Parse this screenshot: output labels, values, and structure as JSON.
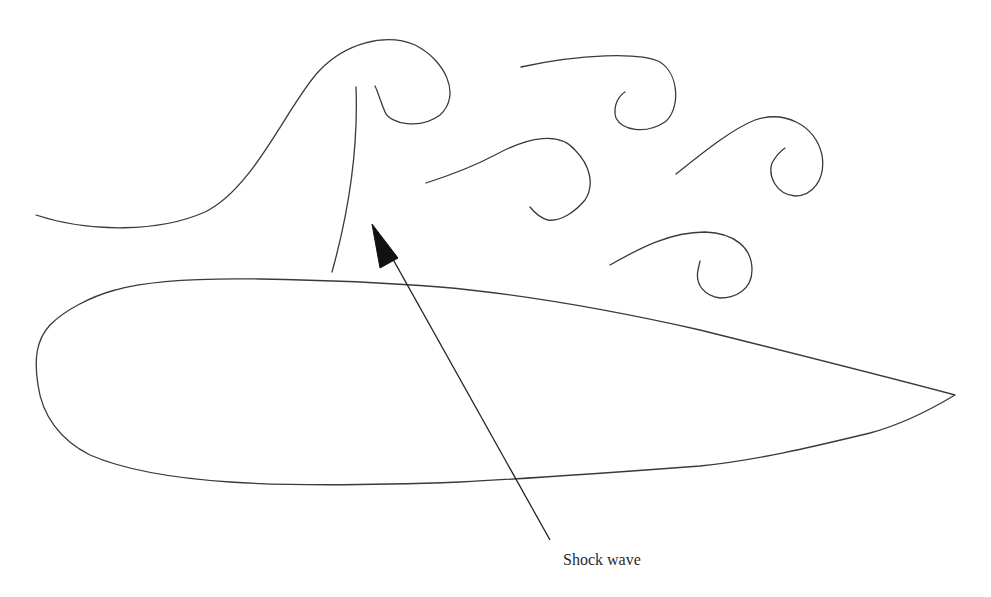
{
  "diagram": {
    "labels": {
      "shock_wave": "Shock wave"
    },
    "colors": {
      "background": "#ffffff",
      "line": "#3a3a3a",
      "arrow": "#111111",
      "text": "#2a2a2a"
    },
    "elements": {
      "airfoil": "airfoil-outline",
      "shock_wave_line": "shock-wave-curve",
      "separated_flow_curl": "flow-curl-large",
      "eddies": [
        "eddy-1",
        "eddy-2",
        "eddy-3",
        "eddy-4"
      ],
      "pointer_arrow": "arrow-to-shock-wave"
    }
  }
}
